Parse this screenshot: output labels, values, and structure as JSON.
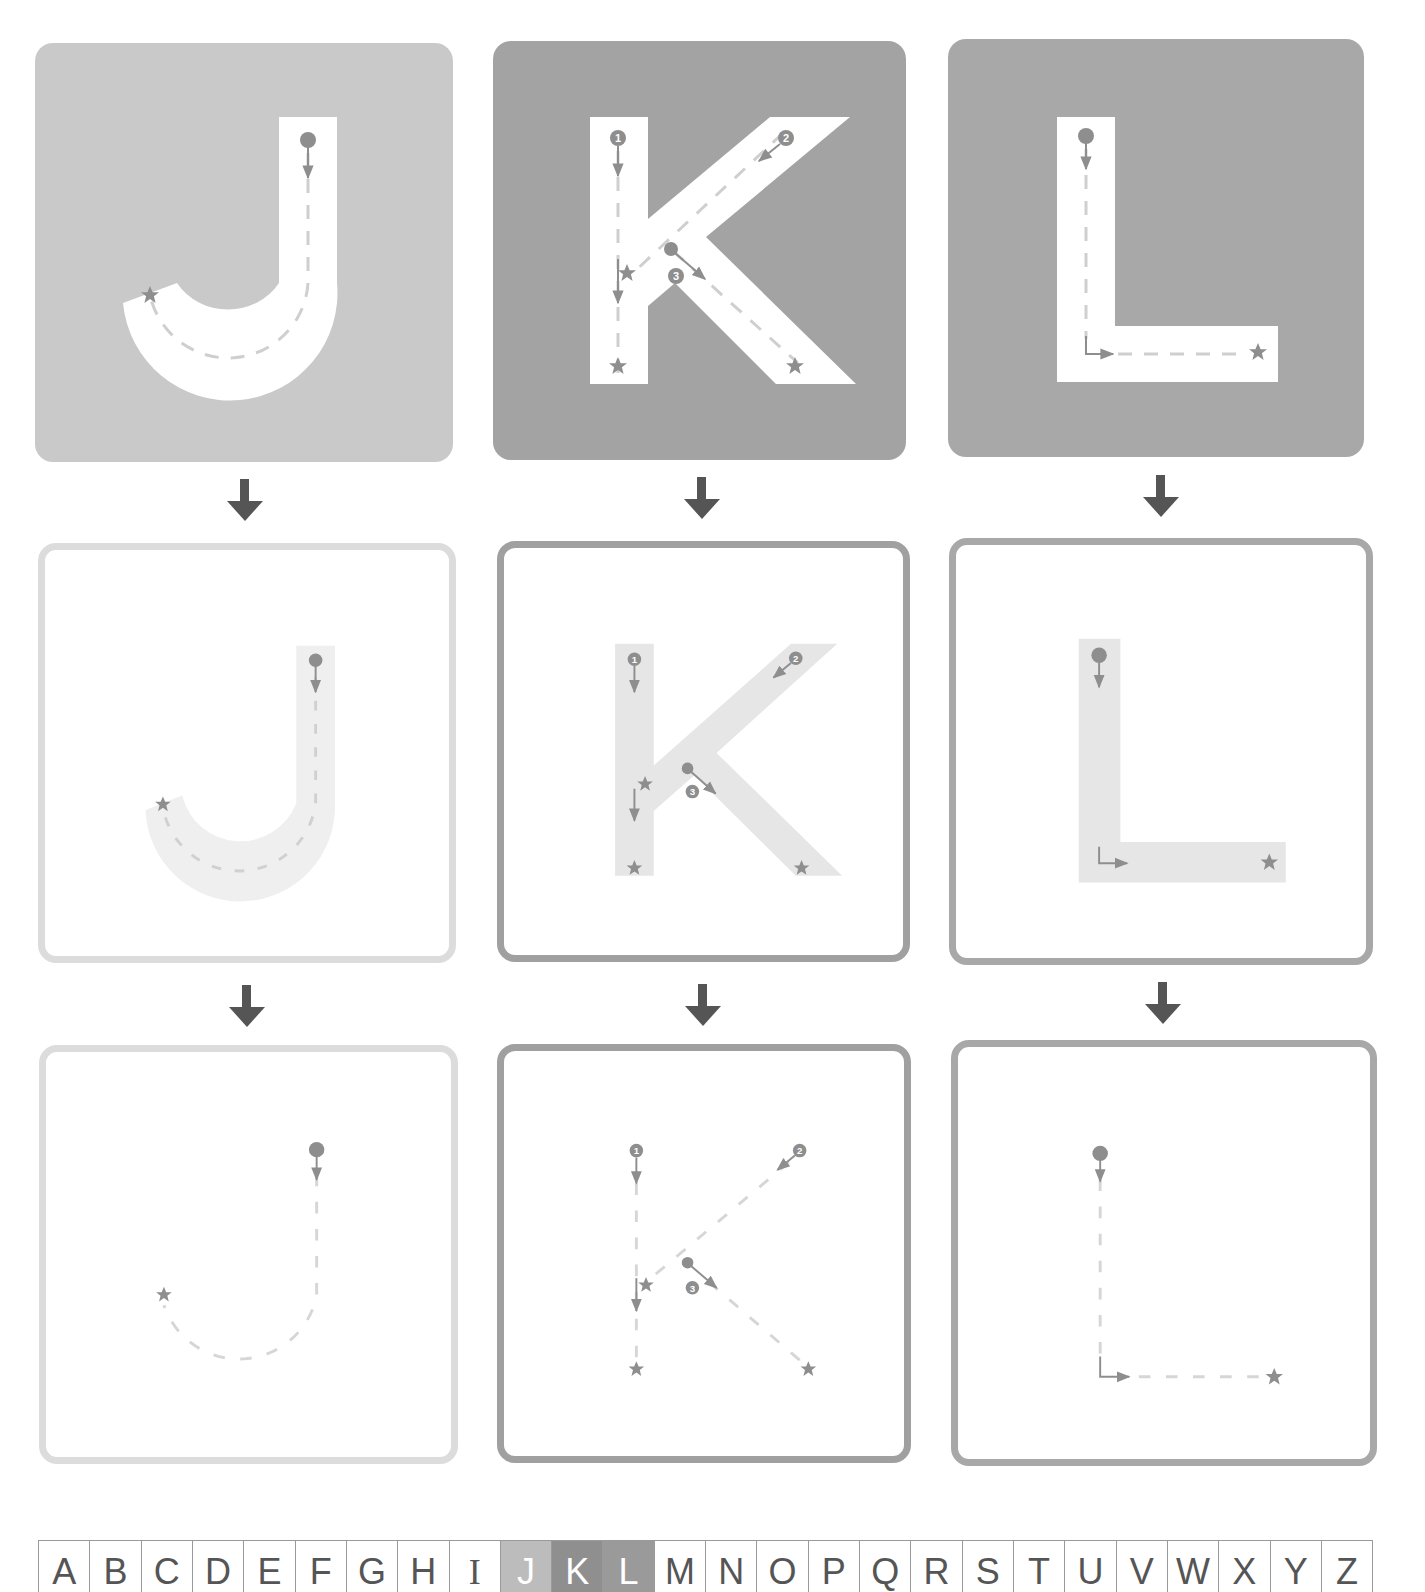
{
  "colors": {
    "j_fill": "#c9c9c9",
    "k_fill": "#a3a3a3",
    "l_fill": "#a8a8a8",
    "letter_white": "#ffffff",
    "j_outline": "#dcdcdc",
    "k_outline": "#a0a0a0",
    "l_outline": "#a8a8a8",
    "ghost_letter": "#ebebeb",
    "marker": "#8e8e8e",
    "dash": "#cfcfcf",
    "arrow": "#555555",
    "strip_j": "#bcbcbc",
    "strip_k": "#8f8f8f",
    "strip_l": "#9a9a9a"
  },
  "letters": [
    {
      "char": "J",
      "strokes": 1,
      "stroke_markers": [
        "start-dot"
      ]
    },
    {
      "char": "K",
      "strokes": 3,
      "stroke_markers": [
        "1",
        "2",
        "3"
      ]
    },
    {
      "char": "L",
      "strokes": 1,
      "stroke_markers": [
        "start-dot"
      ]
    }
  ],
  "rows": [
    {
      "stage": "filled-letter"
    },
    {
      "stage": "faded-letter"
    },
    {
      "stage": "dashed-path-only"
    }
  ],
  "strokes_labels": {
    "k1": "1",
    "k2": "2",
    "k3": "3"
  },
  "alphabet": {
    "letters": [
      "A",
      "B",
      "C",
      "D",
      "E",
      "F",
      "G",
      "H",
      "I",
      "J",
      "K",
      "L",
      "M",
      "N",
      "O",
      "P",
      "Q",
      "R",
      "S",
      "T",
      "U",
      "V",
      "W",
      "X",
      "Y",
      "Z"
    ],
    "highlighted": [
      "J",
      "K",
      "L"
    ]
  }
}
